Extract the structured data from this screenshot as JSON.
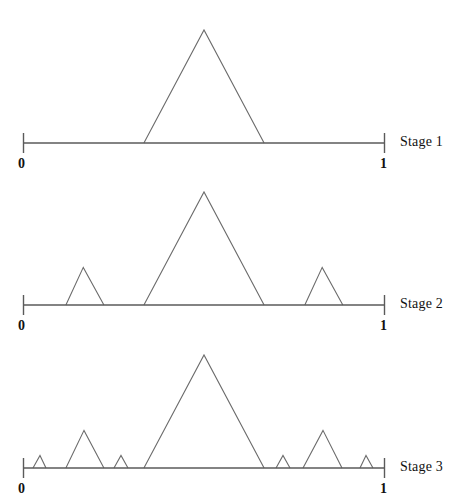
{
  "figure": {
    "title": "",
    "background": "#ffffff",
    "line_color": "#6b6b6b",
    "axis_color": "#5a5a5a",
    "text_color": "#111111"
  },
  "chart_data": {
    "type": "line",
    "title": "",
    "subtitle": "",
    "xlabel": "",
    "ylabel": "",
    "xlim": [
      0,
      1
    ],
    "ylim": [
      0,
      1
    ],
    "grid": false,
    "legend": "none",
    "axis_ticks": [
      "0",
      "1"
    ],
    "panels": [
      {
        "label": "Stage 1",
        "triangle_count": 1,
        "triangles": [
          {
            "left": 0.334,
            "apex": 0.5,
            "right": 0.666,
            "height": 1.0
          }
        ]
      },
      {
        "label": "Stage 2",
        "triangle_count": 3,
        "triangles": [
          {
            "left": 0.1185,
            "apex": 0.1665,
            "right": 0.2235,
            "height": 0.333
          },
          {
            "left": 0.334,
            "apex": 0.5,
            "right": 0.666,
            "height": 1.0
          },
          {
            "left": 0.7785,
            "apex": 0.8265,
            "right": 0.8835,
            "height": 0.333
          }
        ]
      },
      {
        "label": "Stage 3",
        "triangle_count": 7,
        "triangles": [
          {
            "left": 0.0276,
            "apex": 0.0469,
            "right": 0.0635,
            "height": 0.111
          },
          {
            "left": 0.1185,
            "apex": 0.1685,
            "right": 0.2235,
            "height": 0.333
          },
          {
            "left": 0.2513,
            "apex": 0.2707,
            "right": 0.29,
            "height": 0.111
          },
          {
            "left": 0.334,
            "apex": 0.5,
            "right": 0.666,
            "height": 1.0
          },
          {
            "left": 0.699,
            "apex": 0.7182,
            "right": 0.7376,
            "height": 0.111
          },
          {
            "left": 0.7735,
            "apex": 0.8287,
            "right": 0.8812,
            "height": 0.333
          },
          {
            "left": 0.9309,
            "apex": 0.9475,
            "right": 0.9668,
            "height": 0.111
          }
        ]
      }
    ]
  },
  "panels": [
    {
      "stage_label": "Stage 1",
      "tick_left": "0",
      "tick_right": "1"
    },
    {
      "stage_label": "Stage 2",
      "tick_left": "0",
      "tick_right": "1"
    },
    {
      "stage_label": "Stage 3",
      "tick_left": "0",
      "tick_right": "1"
    }
  ]
}
